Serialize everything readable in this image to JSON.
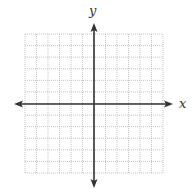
{
  "diagram": {
    "type": "coordinate-plane",
    "x_axis_label": "x",
    "y_axis_label": "y",
    "grid": {
      "columns": 12,
      "rows": 12,
      "cells_left_of_origin": 6,
      "cells_right_of_origin": 6,
      "cells_above_origin": 6,
      "cells_below_origin": 6,
      "line_color": "#b5b5b5",
      "line_style": "dotted"
    },
    "axes": {
      "color": "#333333",
      "arrows": [
        "left",
        "right",
        "up",
        "down"
      ]
    }
  },
  "chart_data": {
    "type": "scatter",
    "title": "",
    "xlabel": "x",
    "ylabel": "y",
    "xlim": [
      -6,
      6
    ],
    "ylim": [
      -6,
      6
    ],
    "grid": true,
    "series": []
  }
}
